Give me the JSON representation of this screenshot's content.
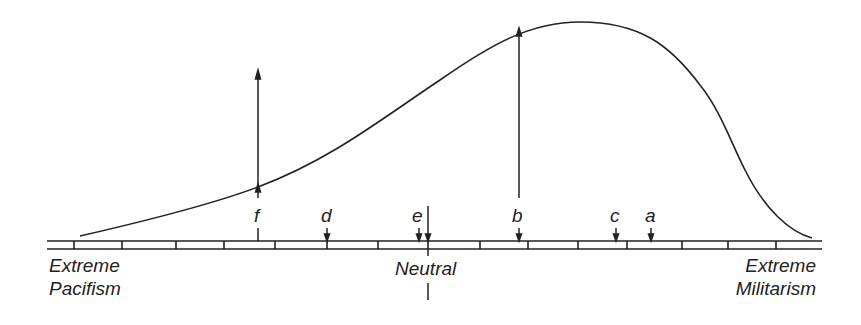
{
  "diagram": {
    "type": "attitude-distribution-curve",
    "scale": {
      "left_label": [
        "Extreme",
        "Pacifism"
      ],
      "center_label": "Neutral",
      "right_label": [
        "Extreme",
        "Militarism"
      ],
      "tick_count": 15
    },
    "markers": [
      {
        "id": "f",
        "label": "f",
        "x": 258,
        "note": "long upward arrow"
      },
      {
        "id": "d",
        "label": "d",
        "x": 327
      },
      {
        "id": "e",
        "label": "e",
        "x": 419
      },
      {
        "id": "b",
        "label": "b",
        "x": 519,
        "note": "long upward arrow to curve peak"
      },
      {
        "id": "c",
        "label": "c",
        "x": 616
      },
      {
        "id": "a",
        "label": "a",
        "x": 651
      }
    ],
    "curve": "skewed distribution peaking right of neutral near b"
  }
}
